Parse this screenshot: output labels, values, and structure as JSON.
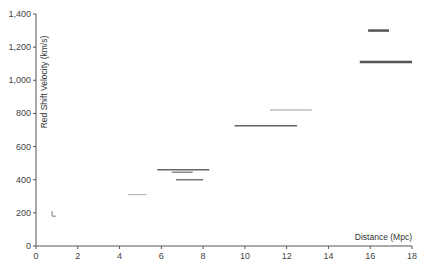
{
  "chart_data": {
    "type": "scatter",
    "subtype": "horizontal-range-segments",
    "title": "",
    "xlabel": "Distance (Mpc)",
    "ylabel": "Red Shift Velocity (km/s)",
    "xlim": [
      0,
      18
    ],
    "ylim": [
      0,
      1400
    ],
    "x_ticks": [
      0,
      2,
      4,
      6,
      8,
      10,
      12,
      14,
      16,
      18
    ],
    "x_tick_labels": [
      "0",
      "2",
      "4",
      "6",
      "8",
      "10",
      "12",
      "14",
      "16",
      "18"
    ],
    "y_ticks": [
      0,
      200,
      400,
      600,
      800,
      1000,
      1200,
      1400
    ],
    "y_tick_labels": [
      "0",
      "200",
      "400",
      "600",
      "800",
      "1,000",
      "1,200",
      "1,400"
    ],
    "grid": false,
    "legend": null,
    "segments": [
      {
        "x_start": 0.77,
        "x_end": 0.95,
        "velocity": 180,
        "color": "#777777",
        "thickness": 1,
        "shape": "corner"
      },
      {
        "x_start": 4.4,
        "x_end": 5.3,
        "velocity": 310,
        "color": "#bbbbbb",
        "thickness": 1.2
      },
      {
        "x_start": 5.8,
        "x_end": 8.3,
        "velocity": 460,
        "color": "#666666",
        "thickness": 1.5
      },
      {
        "x_start": 6.5,
        "x_end": 7.5,
        "velocity": 445,
        "color": "#888888",
        "thickness": 1.5
      },
      {
        "x_start": 6.7,
        "x_end": 8.0,
        "velocity": 400,
        "color": "#777777",
        "thickness": 1.5
      },
      {
        "x_start": 9.5,
        "x_end": 12.5,
        "velocity": 725,
        "color": "#666666",
        "thickness": 1.5
      },
      {
        "x_start": 11.2,
        "x_end": 13.2,
        "velocity": 820,
        "color": "#bbbbbb",
        "thickness": 1.5
      },
      {
        "x_start": 15.5,
        "x_end": 18.0,
        "velocity": 1110,
        "color": "#555555",
        "thickness": 2.5
      },
      {
        "x_start": 15.9,
        "x_end": 16.9,
        "velocity": 1300,
        "color": "#555555",
        "thickness": 2.5
      }
    ]
  },
  "axes": {
    "x_title": "Distance (Mpc)",
    "y_title": "Red Shift Velocity (km/s)"
  }
}
